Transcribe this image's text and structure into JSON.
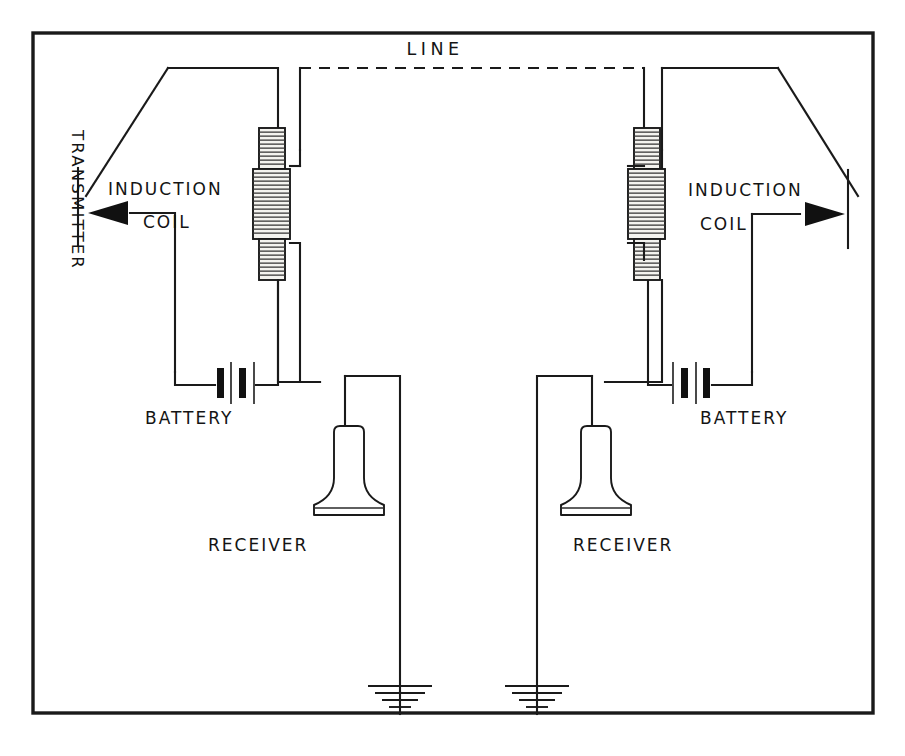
{
  "figure": {
    "title_label": "LINE",
    "labels": {
      "line": "LINE",
      "transmitter": "TRANSMITTER",
      "induction_coil_left_1": "INDUCTION",
      "induction_coil_left_2": "COIL",
      "induction_coil_right_1": "INDUCTION",
      "induction_coil_right_2": "COIL",
      "battery_left": "BATTERY",
      "battery_right": "BATTERY",
      "receiver_left": "RECEIVER",
      "receiver_right": "RECEIVER"
    },
    "colors": {
      "ink": "#1a1a1a",
      "paper": "#ffffff",
      "coil_fill": "#f4f3ef"
    },
    "components": [
      {
        "name": "transmitter-left",
        "label": "TRANSMITTER",
        "side": "left"
      },
      {
        "name": "induction-coil-left",
        "label": "INDUCTION COIL",
        "side": "left"
      },
      {
        "name": "battery-left",
        "label": "BATTERY",
        "side": "left",
        "cells": 2
      },
      {
        "name": "receiver-left",
        "label": "RECEIVER",
        "side": "left"
      },
      {
        "name": "ground-left",
        "label": "",
        "side": "left",
        "bars": 4
      },
      {
        "name": "induction-coil-right",
        "label": "INDUCTION COIL",
        "side": "right"
      },
      {
        "name": "battery-right",
        "label": "BATTERY",
        "side": "right",
        "cells": 2
      },
      {
        "name": "receiver-right",
        "label": "RECEIVER",
        "side": "right"
      },
      {
        "name": "ground-right",
        "label": "",
        "side": "right",
        "bars": 4
      },
      {
        "name": "transmitter-right",
        "label": "",
        "side": "right"
      }
    ]
  }
}
